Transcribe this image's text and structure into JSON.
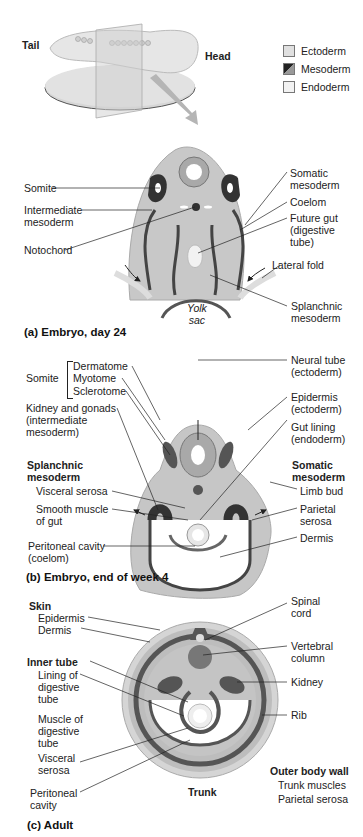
{
  "top": {
    "tail_label": "Tail",
    "head_label": "Head"
  },
  "legend": {
    "items": [
      {
        "label": "Ectoderm",
        "color": "#e0e0e0"
      },
      {
        "label": "Mesoderm",
        "color": "#3a3a3a"
      },
      {
        "label": "Endoderm",
        "color": "#f2f2f2"
      }
    ]
  },
  "panel_a": {
    "caption": "(a) Embryo, day 24",
    "labels": {
      "somite": "Somite",
      "intermediate_mesoderm": "Intermediate\nmesoderm",
      "notochord": "Notochord",
      "somatic_mesoderm": "Somatic\nmesoderm",
      "coelom": "Coelom",
      "future_gut": "Future gut\n(digestive\ntube)",
      "lateral_fold": "Lateral fold",
      "yolk_sac": "Yolk\nsac",
      "splanchnic_mesoderm": "Splanchnic\nmesoderm"
    }
  },
  "panel_b": {
    "caption": "(b) Embryo, end of week 4",
    "labels": {
      "somite": "Somite",
      "dermatome": "Dermatome",
      "myotome": "Myotome",
      "sclerotome": "Sclerotome",
      "kidney_gonads": "Kidney and gonads\n(intermediate\nmesoderm)",
      "splanchnic_mesoderm": "Splanchnic\nmesoderm",
      "visceral_serosa": "Visceral serosa",
      "smooth_muscle": "Smooth muscle\nof gut",
      "peritoneal_cavity": "Peritoneal cavity\n(coelom)",
      "neural_tube": "Neural tube\n(ectoderm)",
      "epidermis": "Epidermis\n(ectoderm)",
      "gut_lining": "Gut lining\n(endoderm)",
      "somatic_mesoderm": "Somatic\nmesoderm",
      "limb_bud": "Limb bud",
      "parietal_serosa": "Parietal\nserosa",
      "dermis": "Dermis"
    }
  },
  "panel_c": {
    "caption": "(c) Adult",
    "labels": {
      "skin": "Skin",
      "epidermis": "Epidermis",
      "dermis": "Dermis",
      "inner_tube": "Inner tube",
      "lining_digestive": "Lining of\ndigestive\ntube",
      "muscle_digestive": "Muscle of\ndigestive\ntube",
      "visceral_serosa": "Visceral\nserosa",
      "peritoneal_cavity": "Peritoneal\ncavity",
      "spinal_cord": "Spinal\ncord",
      "vertebral_column": "Vertebral\ncolumn",
      "kidney": "Kidney",
      "rib": "Rib",
      "outer_body_wall": "Outer body wall",
      "trunk_muscles": "Trunk muscles",
      "parietal_serosa": "Parietal serosa",
      "trunk": "Trunk"
    }
  }
}
